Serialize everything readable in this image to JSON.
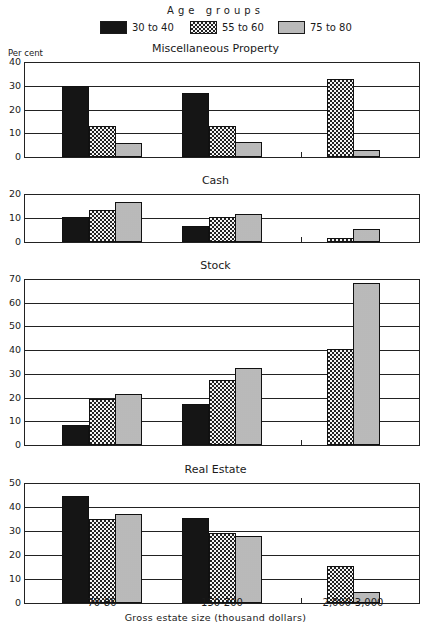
{
  "legend": {
    "title": "Age groups",
    "items": [
      {
        "label": "30 to 40",
        "fill": "black"
      },
      {
        "label": "55 to 60",
        "fill": "cross"
      },
      {
        "label": "75 to 80",
        "fill": "dots"
      }
    ]
  },
  "y_axis_unit": "Per cent",
  "x_axis": {
    "title": "Gross estate size  (thousand dollars)",
    "categories": [
      "70-80",
      "150-200",
      "2,000-3,000"
    ]
  },
  "panels": [
    {
      "title": "Miscellaneous Property",
      "yticks": [
        "40",
        "30",
        "20",
        "10",
        "0"
      ]
    },
    {
      "title": "Cash",
      "yticks": [
        "20",
        "10",
        "0"
      ]
    },
    {
      "title": "Stock",
      "yticks": [
        "70",
        "60",
        "50",
        "40",
        "30",
        "20",
        "10",
        "0"
      ]
    },
    {
      "title": "Real Estate",
      "yticks": [
        "50",
        "40",
        "30",
        "20",
        "10",
        "0"
      ]
    }
  ],
  "chart_data": {
    "type": "bar",
    "xlabel": "Gross estate size (thousand dollars)",
    "ylabel": "Per cent",
    "categories": [
      "70-80",
      "150-200",
      "2,000-3,000"
    ],
    "legend": [
      "30 to 40",
      "55 to 60",
      "75 to 80"
    ],
    "legend_position": "top",
    "grid": true,
    "subplots": [
      {
        "title": "Miscellaneous Property",
        "ylim": [
          0,
          40
        ],
        "series": [
          {
            "name": "30 to 40",
            "values": [
              30,
              27,
              null
            ]
          },
          {
            "name": "55 to 60",
            "values": [
              13,
              13,
              33
            ]
          },
          {
            "name": "75 to 80",
            "values": [
              6,
              6.5,
              3
            ]
          }
        ]
      },
      {
        "title": "Cash",
        "ylim": [
          0,
          20
        ],
        "series": [
          {
            "name": "30 to 40",
            "values": [
              10.3,
              6.5,
              null
            ]
          },
          {
            "name": "55 to 60",
            "values": [
              13.2,
              10.5,
              1.5
            ]
          },
          {
            "name": "75 to 80",
            "values": [
              16.8,
              11.5,
              5.5
            ]
          }
        ]
      },
      {
        "title": "Stock",
        "ylim": [
          0,
          70
        ],
        "series": [
          {
            "name": "30 to 40",
            "values": [
              8.5,
              17.5,
              null
            ]
          },
          {
            "name": "55 to 60",
            "values": [
              19.5,
              27.5,
              40.5
            ]
          },
          {
            "name": "75 to 80",
            "values": [
              21.5,
              32.5,
              68.5
            ]
          }
        ]
      },
      {
        "title": "Real Estate",
        "ylim": [
          0,
          50
        ],
        "series": [
          {
            "name": "30 to 40",
            "values": [
              44.5,
              35.5,
              null
            ]
          },
          {
            "name": "55 to 60",
            "values": [
              35,
              29,
              15.5
            ]
          },
          {
            "name": "75 to 80",
            "values": [
              37,
              28,
              4.5
            ]
          }
        ]
      }
    ]
  }
}
